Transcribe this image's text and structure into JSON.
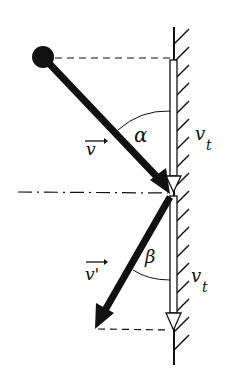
{
  "diagram": {
    "title": "",
    "labels": {
      "v": "v",
      "v_prime": "v'",
      "alpha": "α",
      "beta": "β",
      "vt_top": "v",
      "vt_top_sub": "t",
      "vt_bottom": "v",
      "vt_bottom_sub": "t"
    },
    "colors": {
      "ink": "#111111",
      "background": "#ffffff"
    },
    "elements": [
      {
        "name": "ball",
        "shape": "circle"
      },
      {
        "name": "wall",
        "shape": "hatched-line"
      },
      {
        "name": "incident-velocity",
        "shape": "thick-arrow",
        "label": "v"
      },
      {
        "name": "reflected-velocity",
        "shape": "thick-arrow",
        "label": "v'"
      },
      {
        "name": "tangential-velocity-top",
        "shape": "hollow-arrow",
        "label": "v_t"
      },
      {
        "name": "tangential-velocity-bottom",
        "shape": "hollow-arrow",
        "label": "v_t"
      },
      {
        "name": "incidence-angle",
        "label": "α"
      },
      {
        "name": "reflection-angle",
        "label": "β"
      }
    ]
  }
}
